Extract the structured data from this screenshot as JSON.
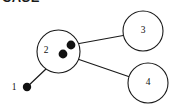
{
  "figure": {
    "clipped_header_text": "CASE",
    "background_color": "#ffffff",
    "stroke_color": "#1a1a1a",
    "dot_fill_color": "#111111",
    "width": 171,
    "height": 108
  },
  "chart_data": {
    "type": "diagram",
    "title": "",
    "diagram_kind": "node-link graph",
    "nodes": [
      {
        "id": "1",
        "label": "1",
        "shape": "filled-dot",
        "cx": 27,
        "cy": 87,
        "r": 4.2,
        "label_x": 14,
        "label_y": 88
      },
      {
        "id": "2",
        "label": "2",
        "shape": "circle",
        "cx": 58.5,
        "cy": 51.5,
        "r": 21.5,
        "label_x": 46,
        "label_y": 51
      },
      {
        "id": "3",
        "label": "3",
        "shape": "circle",
        "cx": 143,
        "cy": 31,
        "r": 20,
        "label_x": 143,
        "label_y": 31
      },
      {
        "id": "4",
        "label": "4",
        "shape": "circle",
        "cx": 148,
        "cy": 83,
        "r": 20,
        "label_x": 148,
        "label_y": 83
      }
    ],
    "inner_points": [
      {
        "id": "p-upper",
        "parent": "2",
        "cx": 71,
        "cy": 45,
        "r": 4.4
      },
      {
        "id": "p-lower",
        "parent": "2",
        "cx": 63,
        "cy": 54,
        "r": 4.4
      }
    ],
    "edges": [
      {
        "id": "e-1-2",
        "from": "1",
        "to": "2",
        "x1": 27,
        "y1": 87,
        "x2": 46.5,
        "y2": 68.5
      },
      {
        "id": "e-p-upper-3",
        "from": "p-upper",
        "to": "3",
        "x1": 71,
        "y1": 45,
        "x2": 123.2,
        "y2": 35.5
      },
      {
        "id": "e-p-lower-4",
        "from": "p-lower",
        "to": "4",
        "x1": 63,
        "y1": 54,
        "x2": 128.5,
        "y2": 76.5
      }
    ]
  }
}
